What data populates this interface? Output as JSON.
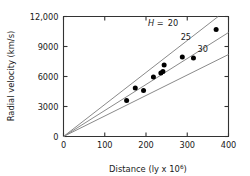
{
  "chart_data": {
    "type": "scatter",
    "title": "",
    "xlabel": "Distance (ly x 10^6)",
    "xlabel_main": "Distance (ly x 10",
    "xlabel_sup": "6",
    "xlabel_tail": ")",
    "ylabel": "Radial velocity (km/s)",
    "xlim": [
      0,
      400
    ],
    "ylim": [
      0,
      12000
    ],
    "grid": false,
    "legend_position": "inline-curve-labels",
    "xticks": [
      0,
      100,
      200,
      300,
      400
    ],
    "xtick_labels": [
      "0",
      "100",
      "200",
      "300",
      "400"
    ],
    "yticks": [
      0,
      3000,
      6000,
      9000,
      12000
    ],
    "ytick_labels": [
      "0",
      "3000",
      "6000",
      "9000",
      "12,000"
    ],
    "point_color": "#000000",
    "line_color": "#8a8a8a",
    "axis_color": "#333333",
    "points": [
      {
        "x": 153,
        "y": 3600
      },
      {
        "x": 174,
        "y": 4850
      },
      {
        "x": 194,
        "y": 4600
      },
      {
        "x": 218,
        "y": 5950
      },
      {
        "x": 236,
        "y": 6350
      },
      {
        "x": 241,
        "y": 6500
      },
      {
        "x": 244,
        "y": 7150
      },
      {
        "x": 288,
        "y": 7950
      },
      {
        "x": 315,
        "y": 7850
      },
      {
        "x": 370,
        "y": 10700
      }
    ],
    "series": [
      {
        "name": "H = 20",
        "slope": 32.0,
        "label": "20",
        "label_prefix": "H =",
        "x_end": 375,
        "y_end": 12000
      },
      {
        "name": "25",
        "slope": 26.0,
        "label": "25",
        "x_end": 400,
        "y_end": 10400
      },
      {
        "name": "30",
        "slope": 20.5,
        "label": "30",
        "x_end": 400,
        "y_end": 8200
      }
    ],
    "annotations": [
      {
        "text": "H =",
        "italic": true,
        "x": 205,
        "y": 11050
      },
      {
        "text": "20",
        "italic": false,
        "x": 253,
        "y": 11050
      },
      {
        "text": "25",
        "italic": false,
        "x": 284,
        "y": 9700
      },
      {
        "text": "30",
        "italic": false,
        "x": 325,
        "y": 8500
      }
    ]
  }
}
